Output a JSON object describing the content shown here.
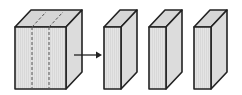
{
  "diagram": {
    "colors": {
      "front_face": "#e2e2e2",
      "top_face": "#d6d6d6",
      "side_face": "#dcdcdc",
      "stroke": "#222222",
      "dash": "#555555",
      "background": "#ffffff"
    },
    "block": {
      "cut_lines": 2
    },
    "arrow": {
      "direction": "right"
    },
    "slabs": [
      {
        "index": 1
      },
      {
        "index": 2
      },
      {
        "index": 3
      }
    ]
  }
}
